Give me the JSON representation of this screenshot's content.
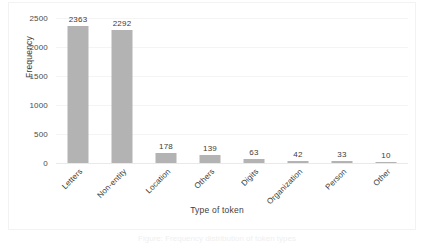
{
  "chart_data": {
    "type": "bar",
    "title": "",
    "xlabel": "Type of token",
    "ylabel": "Frequency",
    "categories": [
      "Letters",
      "Non-entity",
      "Location",
      "Others",
      "Digits",
      "Organization",
      "Person",
      "Other"
    ],
    "values": [
      2363,
      2292,
      178,
      139,
      63,
      42,
      33,
      10
    ],
    "data_labels": [
      "2363",
      "2292",
      "178",
      "139",
      "63",
      "42",
      "33",
      "10"
    ],
    "ylim": [
      0,
      2500
    ],
    "yticks": [
      2500,
      2000,
      1500,
      1000,
      500,
      0
    ],
    "ytick_labels": [
      "2500",
      "2000",
      "1500",
      "1000",
      "500",
      "0"
    ],
    "grid": true,
    "legend": false,
    "bar_color": "#b3b3b3",
    "background_color": "#ffffff",
    "frame_color": "#f2f2f2",
    "gridline_color": "#f4f4f4",
    "text_color": "#3a3a3a"
  },
  "caption": {
    "text": "Figure: Frequency distribution of token types"
  }
}
